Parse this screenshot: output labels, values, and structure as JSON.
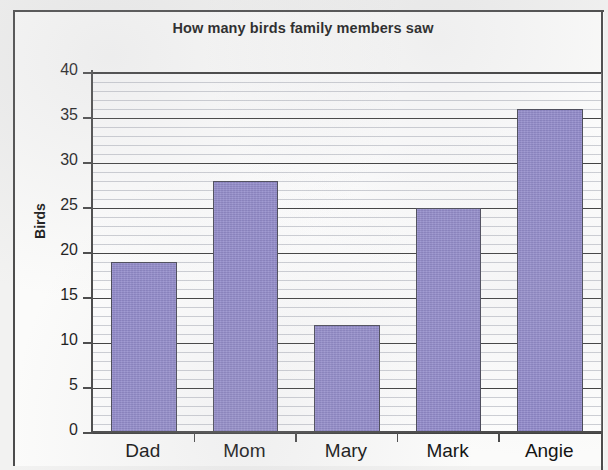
{
  "chart_data": {
    "type": "bar",
    "title": "How many birds family members saw",
    "xlabel": "",
    "ylabel": "Birds",
    "categories": [
      "Dad",
      "Mom",
      "Mary",
      "Mark",
      "Angie"
    ],
    "values": [
      19,
      28,
      12,
      25,
      36
    ],
    "ylim": [
      0,
      40
    ],
    "ytick_labels": [
      "40",
      "35",
      "30",
      "25",
      "20",
      "15",
      "10",
      "5",
      "0"
    ],
    "ytick_values": [
      40,
      35,
      30,
      25,
      20,
      15,
      10,
      5,
      0
    ],
    "ytick_step": 5,
    "minor_gridline_step": 1,
    "grid": "horizontal-major-and-minor",
    "legend": "none",
    "bar_color": "#9189cc",
    "bar_border_color": "#4a4a58",
    "axis_color": "#4a4a4a",
    "major_gridline_color": "#3f3f3f",
    "minor_gridline_color": "#c3c5cc",
    "plot_background": "#fdfdfd",
    "page_background": "#f2f2f1",
    "frame_border_color": "#4c4c4c"
  }
}
